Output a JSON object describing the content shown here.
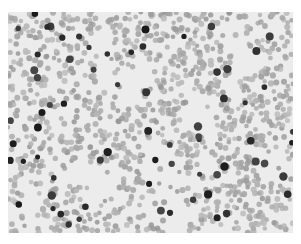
{
  "image": {
    "subject": "blood smear micrograph (grayscale)",
    "background_color": "#ffffff",
    "field_color": "#ececec",
    "cell_color": "#a9a9a9",
    "dark_cell_color": "#2a2a2a",
    "field": {
      "x": 8,
      "y": 12,
      "width": 285,
      "height": 221
    },
    "cell_count": 1400,
    "dark_cell_count": 70,
    "seed": 7
  }
}
